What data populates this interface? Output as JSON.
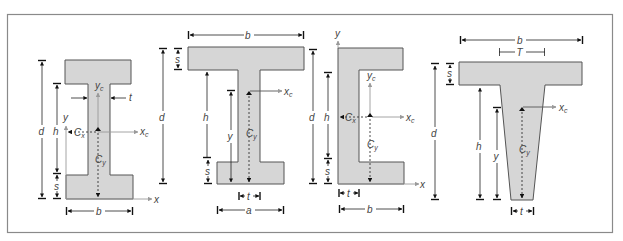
{
  "figure": {
    "colors": {
      "section_fill": "#d6d6d6",
      "outline": "#555555",
      "frame": "#8a8a8a",
      "axis": "#9a9a9a"
    },
    "shapes": [
      {
        "name": "I-beam (symmetric)",
        "labels": {
          "d": "d",
          "h": "h",
          "s": "s",
          "b": "b",
          "t": "t",
          "x": "x",
          "y": "y",
          "xc": "x",
          "xc_sub": "c",
          "yc": "y",
          "yc_sub": "c",
          "cx": "C",
          "cx_sub": "x",
          "cy": "C",
          "cy_sub": "y"
        }
      },
      {
        "name": "I-beam (unequal flanges)",
        "labels": {
          "b": "b",
          "d": "d",
          "s_top": "s",
          "h": "h",
          "s_bottom": "s",
          "y": "y",
          "xc": "x",
          "xc_sub": "c",
          "cy": "C",
          "cy_sub": "y",
          "t": "t",
          "a": "a"
        }
      },
      {
        "name": "Channel",
        "labels": {
          "d": "d",
          "h": "h",
          "s": "s",
          "t": "t",
          "b": "b",
          "x": "x",
          "y": "y",
          "xc": "x",
          "xc_sub": "c",
          "yc": "y",
          "yc_sub": "c",
          "cx": "C",
          "cx_sub": "x",
          "cy": "C",
          "cy_sub": "y"
        }
      },
      {
        "name": "Tapered T-section",
        "labels": {
          "b": "b",
          "T": "T",
          "s": "s",
          "d": "d",
          "h": "h",
          "y": "y",
          "xc": "x",
          "xc_sub": "c",
          "cy": "C",
          "cy_sub": "y",
          "t": "t"
        }
      }
    ]
  }
}
